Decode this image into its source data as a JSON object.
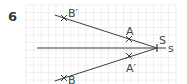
{
  "exercise_number": "6",
  "grid": {
    "x0": 26,
    "y0": 5,
    "x1": 177,
    "y1": 84,
    "cell": 7.5,
    "color": "#e6e6e6"
  },
  "colors": {
    "line": "#3c3c3c",
    "label": "#444444"
  },
  "points": [
    {
      "name": "B'",
      "label": "B′",
      "x": 64,
      "y": 18,
      "lx": 68,
      "ly": 17
    },
    {
      "name": "A",
      "label": "A",
      "x": 129,
      "y": 39,
      "lx": 126,
      "ly": 35
    },
    {
      "name": "A'",
      "label": "A′",
      "x": 129,
      "y": 56,
      "lx": 126,
      "ly": 72
    },
    {
      "name": "B",
      "label": "B",
      "x": 64,
      "y": 78,
      "lx": 68,
      "ly": 84
    }
  ],
  "center": {
    "name": "S",
    "label": "S",
    "x": 157,
    "y": 48,
    "lx": 159,
    "ly": 44
  },
  "axis": {
    "label": "s",
    "x_start": 37,
    "x_end": 166,
    "y": 48,
    "lx": 168,
    "ly": 52
  }
}
